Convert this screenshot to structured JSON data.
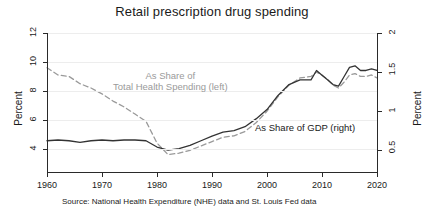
{
  "chart_data": {
    "type": "line",
    "title": "Retail prescription drug spending",
    "xlabel": "",
    "ylabel": "Percent",
    "ylabel_right": "Percent",
    "xlim": [
      1960,
      2020
    ],
    "ylim": [
      3.0,
      12.6
    ],
    "ylim_right": [
      0.32,
      2.1
    ],
    "xticks": [
      1960,
      1970,
      1980,
      1990,
      2000,
      2010,
      2020
    ],
    "yticks": [
      4,
      6,
      8,
      10,
      12
    ],
    "yticks_right": [
      0.5,
      1,
      1.5,
      2
    ],
    "grid": true,
    "legend": "in-plot annotations",
    "annotations": [
      {
        "text_line1": "As Share of",
        "text_line2": "Total Health Spending (left)",
        "color": "#9a9a9a"
      },
      {
        "text": "As Share of GDP (right)",
        "color": "#1a1a1a"
      }
    ],
    "series": [
      {
        "name": "As Share of Total Health Spending (left)",
        "axis": "left",
        "style": "dashed",
        "color": "#9a9a9a",
        "x": [
          1960,
          1962,
          1964,
          1966,
          1968,
          1970,
          1972,
          1974,
          1976,
          1978,
          1980,
          1982,
          1984,
          1986,
          1988,
          1990,
          1992,
          1994,
          1996,
          1998,
          2000,
          2002,
          2004,
          2006,
          2008,
          2009,
          2010,
          2011,
          2012,
          2013,
          2014,
          2015,
          2016,
          2017,
          2018,
          2019,
          2020
        ],
        "values": [
          10.2,
          9.7,
          9.6,
          9.1,
          8.8,
          8.4,
          7.9,
          7.5,
          7.0,
          6.5,
          5.0,
          4.2,
          4.3,
          4.5,
          4.8,
          5.1,
          5.4,
          5.5,
          5.8,
          6.4,
          7.2,
          8.2,
          9.0,
          9.5,
          9.6,
          9.9,
          9.7,
          9.4,
          9.0,
          8.8,
          9.2,
          9.7,
          9.8,
          9.6,
          9.6,
          9.7,
          9.5
        ]
      },
      {
        "name": "As Share of GDP (right)",
        "axis": "right",
        "style": "solid",
        "color": "#333333",
        "x": [
          1960,
          1962,
          1964,
          1966,
          1968,
          1970,
          1972,
          1974,
          1976,
          1978,
          1980,
          1982,
          1984,
          1986,
          1988,
          1990,
          1992,
          1994,
          1996,
          1998,
          2000,
          2002,
          2004,
          2006,
          2008,
          2009,
          2010,
          2011,
          2012,
          2013,
          2014,
          2015,
          2016,
          2017,
          2018,
          2019,
          2020
        ],
        "values": [
          0.72,
          0.73,
          0.72,
          0.7,
          0.72,
          0.73,
          0.72,
          0.73,
          0.73,
          0.72,
          0.64,
          0.6,
          0.62,
          0.66,
          0.72,
          0.78,
          0.83,
          0.85,
          0.9,
          1.0,
          1.12,
          1.3,
          1.44,
          1.5,
          1.5,
          1.62,
          1.56,
          1.5,
          1.44,
          1.42,
          1.54,
          1.66,
          1.68,
          1.62,
          1.62,
          1.64,
          1.62
        ]
      }
    ]
  },
  "chart": {
    "title": "Retail prescription drug spending",
    "y_axis_label": "Percent",
    "y_axis_label_right": "Percent",
    "x_tick_labels": [
      "1960",
      "1970",
      "1980",
      "1990",
      "2000",
      "2010",
      "2020"
    ],
    "y_tick_labels": [
      "4",
      "6",
      "8",
      "10",
      "12"
    ],
    "y_tick_labels_right": [
      "0.5",
      "1",
      "1.5",
      "2"
    ],
    "annotation_health_line1": "As Share of",
    "annotation_health_line2": "Total Health Spending (left)",
    "annotation_gdp": "As Share of GDP (right)",
    "source": "Source: National Health Expenditure (NHE) data and St. Louis Fed data"
  }
}
